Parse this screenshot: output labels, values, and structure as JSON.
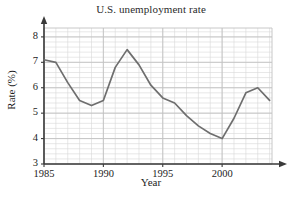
{
  "chart_data": {
    "type": "line",
    "title": "U.S. unemployment rate",
    "xlabel": "Year",
    "ylabel": "Rate (%)",
    "xlim": [
      1985,
      2004.2
    ],
    "ylim": [
      3,
      8.35
    ],
    "grid": true,
    "grid_major_x_step": 5,
    "grid_minor_x_step": 1,
    "grid_major_y_step": 1,
    "grid_minor_y_step": 0.2,
    "legend": "none",
    "x_tick_labels": [
      "1985",
      "1990",
      "1995",
      "2000"
    ],
    "x_tick_values": [
      1985,
      1990,
      1995,
      2000
    ],
    "y_tick_labels": [
      "3",
      "4",
      "5",
      "6",
      "7",
      "8"
    ],
    "y_tick_values": [
      3,
      4,
      5,
      6,
      7,
      8
    ],
    "line_color": "#6e6e6e",
    "axis_color": "#3a3a3a",
    "grid_color": "#d9d9d9",
    "series": [
      {
        "name": "U.S. unemployment rate",
        "x": [
          1985,
          1986,
          1987,
          1988,
          1989,
          1990,
          1991,
          1992,
          1993,
          1994,
          1995,
          1996,
          1997,
          1998,
          1999,
          2000,
          2001,
          2002,
          2003,
          2004
        ],
        "values": [
          7.1,
          7.0,
          6.2,
          5.5,
          5.3,
          5.5,
          6.8,
          7.5,
          6.9,
          6.1,
          5.6,
          5.4,
          4.9,
          4.5,
          4.2,
          4.0,
          4.8,
          5.8,
          6.0,
          5.5
        ]
      }
    ]
  }
}
